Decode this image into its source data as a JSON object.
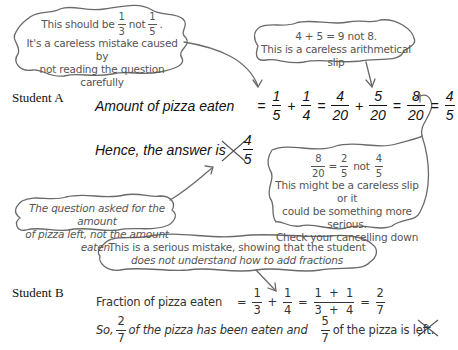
{
  "notes": {
    "note1": {
      "line1_prefix": "This should be",
      "frac_a": {
        "n": "1",
        "d": "3"
      },
      "line1_mid": "not",
      "frac_b": {
        "n": "1",
        "d": "5"
      },
      "line1_end": ".",
      "line2": "It's a careless mistake caused by",
      "line3": "not reading the question carefully"
    },
    "note2": {
      "line1": "4 + 5 = 9 not 8.",
      "line2": "This is a careless arithmetical slip"
    },
    "note3": {
      "line1": "The question asked for the amount",
      "line2": "of pizza left, not the amount eaten."
    },
    "note4": {
      "frac_a": {
        "n": "8",
        "d": "20"
      },
      "eq": "=",
      "frac_b": {
        "n": "2",
        "d": "5"
      },
      "mid": "not",
      "frac_c": {
        "n": "4",
        "d": "5"
      },
      "line2": "This might be a careless slip or it",
      "line3": "could be something more serious.",
      "line4": "Check your cancelling down"
    },
    "note5": {
      "line1": "This is a serious mistake, showing that the student",
      "line2": "does not understand how to add fractions"
    }
  },
  "student_a": {
    "label": "Student A",
    "line1_text": "Amount of pizza eaten",
    "eq": "=",
    "plus": "+",
    "f1": {
      "n": "1",
      "d": "5"
    },
    "f2": {
      "n": "1",
      "d": "4"
    },
    "f3": {
      "n": "4",
      "d": "20"
    },
    "f4": {
      "n": "5",
      "d": "20"
    },
    "f5": {
      "n": "8",
      "d": "20"
    },
    "f6": {
      "n": "4",
      "d": "5"
    },
    "line2_text": "Hence, the answer is",
    "answer": {
      "n": "4",
      "d": "5"
    },
    "mark": "wrong"
  },
  "student_b": {
    "label": "Student B",
    "line1_text": "Fraction of pizza eaten",
    "eq": "=",
    "plus": "+",
    "f1": {
      "n": "1",
      "d": "3"
    },
    "f2": {
      "n": "1",
      "d": "4"
    },
    "f3": {
      "n": "1 + 1",
      "d": "3 + 4"
    },
    "f4": {
      "n": "2",
      "d": "7"
    },
    "line2_prefix": "So,",
    "line2_frac1": {
      "n": "2",
      "d": "7"
    },
    "line2_mid": "of the pizza has been eaten and",
    "line2_frac2": {
      "n": "5",
      "d": "7"
    },
    "line2_end": "of the pizza is left.",
    "mark": "wrong"
  },
  "colors": {
    "cloud_stroke": "#6a6a6a",
    "note_text": "#555555",
    "ink": "#111111"
  }
}
